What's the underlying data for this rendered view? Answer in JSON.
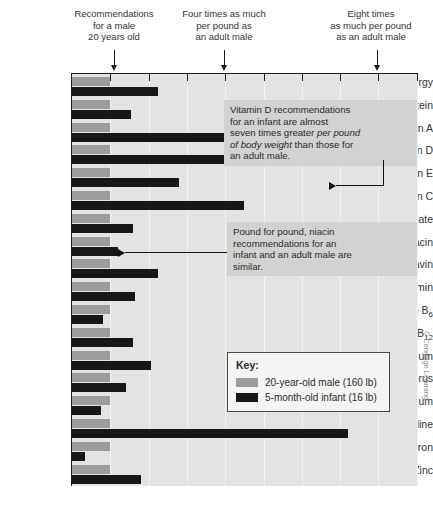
{
  "chart_data": {
    "type": "bar",
    "title": "",
    "xlabel": "Multiples of adult male recommendation per pound",
    "ylabel": "",
    "orientation": "horizontal",
    "xlim": [
      0,
      9
    ],
    "grid": true,
    "legend_position": "inside-right-lower",
    "categories": [
      "Energy",
      "Protein",
      "Vitamin A",
      "Vitamin D",
      "Vitamin E",
      "Vitamin C",
      "Folate",
      "Niacin",
      "Riboflavin",
      "Thiamin",
      "Vitamin B6",
      "Vitamin B12",
      "Calcium",
      "Phosphorus",
      "Magnesium",
      "Iodine",
      "Iron",
      "Zinc"
    ],
    "series": [
      {
        "name": "20-year-old male (160 lb)",
        "color": "#9c9c9c",
        "values": [
          1.0,
          1.0,
          1.0,
          1.0,
          1.0,
          1.0,
          1.0,
          1.0,
          1.0,
          1.0,
          1.0,
          1.0,
          1.0,
          1.0,
          1.0,
          1.0,
          1.0,
          1.0
        ]
      },
      {
        "name": "5-month-old infant (16 lb)",
        "color": "#171717",
        "values": [
          2.25,
          1.55,
          4.3,
          6.6,
          2.8,
          4.5,
          1.6,
          1.2,
          2.25,
          1.65,
          0.8,
          1.6,
          2.05,
          1.4,
          0.75,
          7.2,
          0.35,
          1.8
        ]
      }
    ],
    "xticks": [
      0,
      1,
      2,
      3,
      4,
      5,
      6,
      7,
      8,
      9
    ]
  },
  "header": {
    "callouts": [
      {
        "text": "Recommendations\nfor a male\n20 years old",
        "value": 1
      },
      {
        "text": "Four times as much\nper pound as\nan adult male",
        "value": 4
      },
      {
        "text": "Eight times\nas much per pound\nas an adult male",
        "value": 8
      }
    ]
  },
  "annotations": [
    {
      "id": "vitamin-d-note",
      "lines": [
        {
          "text": "Vitamin D recommendations",
          "italic": false
        },
        {
          "text": "for an infant are almost",
          "italic": false
        },
        {
          "text": "seven times greater ",
          "italic": false,
          "tail": "per pound",
          "tail_italic": true
        },
        {
          "text": "of body weight",
          "italic": true,
          "tail": " than those for",
          "tail_italic": false
        },
        {
          "text": "an adult male.",
          "italic": false
        }
      ],
      "target_category": "Vitamin D"
    },
    {
      "id": "niacin-note",
      "lines": [
        {
          "text": "Pound for pound, niacin",
          "italic": false
        },
        {
          "text": "recommendations for an",
          "italic": false
        },
        {
          "text": "infant and an adult male are",
          "italic": false
        },
        {
          "text": "similar.",
          "italic": false
        }
      ],
      "target_category": "Niacin"
    }
  ],
  "key": {
    "title": "Key:",
    "entries": [
      {
        "label": "20-year-old male (160 lb)",
        "color": "#9c9c9c"
      },
      {
        "label": "5-month-old infant (16 lb)",
        "color": "#171717"
      }
    ]
  },
  "credit": {
    "text": "© Cengage Learning"
  }
}
